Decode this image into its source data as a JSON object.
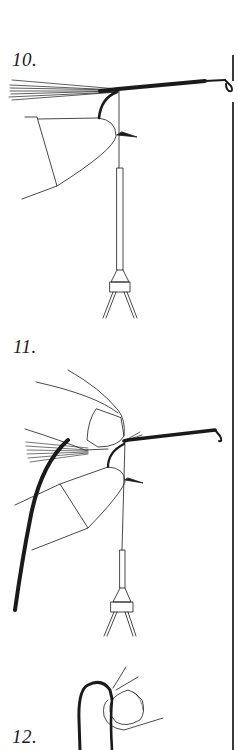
{
  "page": {
    "type": "illustrated-instructions",
    "colors": {
      "ink": "#1a1a1a",
      "paper": "#ffffff",
      "divider": "#3a3a3a"
    }
  },
  "steps": [
    {
      "number": "10.",
      "description": "hook in vise with tail fibers, thread hanging to bobbin, fingers holding"
    },
    {
      "number": "11.",
      "description": "thumb and finger pinching over hook, dark thread looped"
    },
    {
      "number": "12.",
      "description": "thread loop over thumb tip"
    }
  ]
}
